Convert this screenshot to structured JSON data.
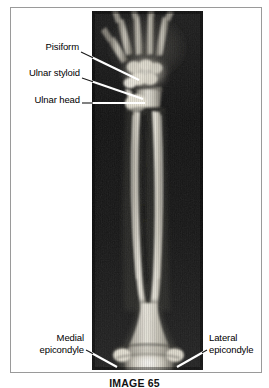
{
  "figure": {
    "caption": "IMAGE 65",
    "modality": "radiograph",
    "region": "upper limb (hand, wrist, forearm and distal humerus)",
    "view": "anteroposterior"
  },
  "labels": [
    {
      "id": "pisiform",
      "name": "Pisiform",
      "line1": "Pisiform",
      "line2": "",
      "side": "left",
      "text_x": 33,
      "text_y": 46,
      "leader": {
        "x1": 81,
        "y1": 52,
        "x2": 139,
        "y2": 80
      }
    },
    {
      "id": "ulnar-styloid",
      "name": "Ulnar styloid",
      "line1": "Ulnar styloid",
      "line2": "",
      "side": "left",
      "text_x": 18,
      "text_y": 72,
      "leader": {
        "x1": 82,
        "y1": 78,
        "x2": 143,
        "y2": 99
      }
    },
    {
      "id": "ulnar-head",
      "name": "Ulnar head",
      "line1": "Ulnar head",
      "line2": "",
      "side": "left",
      "text_x": 24,
      "text_y": 99,
      "leader": {
        "x1": 82,
        "y1": 103,
        "x2": 145,
        "y2": 103
      }
    },
    {
      "id": "medial-epicondyle",
      "name": "Medial epicondyle",
      "line1": "Medial",
      "line2": "epicondyle",
      "side": "left",
      "text_x": 23,
      "text_y": 337,
      "leader": {
        "x1": 86,
        "y1": 350,
        "x2": 117,
        "y2": 367
      }
    },
    {
      "id": "lateral-epicondyle",
      "name": "Lateral epicondyle",
      "line1": "Lateral",
      "line2": "epicondyle",
      "side": "right",
      "text_x": 208,
      "text_y": 337,
      "leader": {
        "x1": 207,
        "y1": 350,
        "x2": 177,
        "y2": 367
      }
    }
  ],
  "colors": {
    "page_background": "#ffffff",
    "frame_border": "#9a9a9a",
    "label_text": "#000000",
    "leader_line_outer": "#ffffff",
    "leader_line_inner": "#1a1a1a",
    "xray_background_dark": "#151515",
    "xray_bone_bright": "#f2f0e8"
  }
}
